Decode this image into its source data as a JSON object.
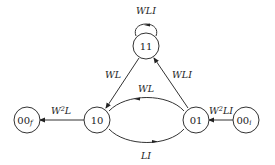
{
  "diagram": {
    "type": "state-transition",
    "nodes": [
      {
        "id": "11",
        "label": "11",
        "subscript": ""
      },
      {
        "id": "10",
        "label": "10",
        "subscript": ""
      },
      {
        "id": "01",
        "label": "01",
        "subscript": ""
      },
      {
        "id": "00i",
        "label": "00",
        "subscript": "i"
      },
      {
        "id": "00f",
        "label": "00",
        "subscript": "f"
      }
    ],
    "edges": [
      {
        "from": "11",
        "to": "11",
        "label": "WLI"
      },
      {
        "from": "11",
        "to": "10",
        "label": "WL"
      },
      {
        "from": "01",
        "to": "11",
        "label": "WLI"
      },
      {
        "from": "01",
        "to": "10",
        "label": "WL"
      },
      {
        "from": "10",
        "to": "01",
        "label": "LI"
      },
      {
        "from": "00i",
        "to": "01",
        "label_base": "W",
        "label_sup": "2",
        "label_rest": "LI"
      },
      {
        "from": "10",
        "to": "00f",
        "label_base": "W",
        "label_sup": "2",
        "label_rest": "L"
      }
    ]
  }
}
